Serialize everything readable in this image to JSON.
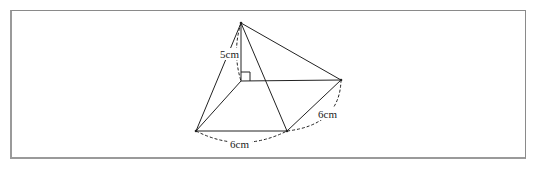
{
  "figure": {
    "labels": {
      "height": "5cm",
      "front_edge": "6cm",
      "right_edge": "6cm"
    },
    "right_angle_marker": true
  }
}
